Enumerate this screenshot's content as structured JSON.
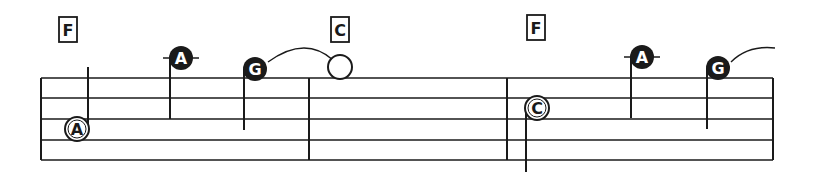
{
  "score": {
    "colors": {
      "ink": "#1a1a1a",
      "paper": "#ffffff"
    },
    "staff": {
      "x_start": 41,
      "x_end": 773,
      "lines_y": [
        78,
        98,
        119,
        140,
        160
      ]
    },
    "barlines_x": [
      41,
      309,
      507,
      773
    ],
    "chords": [
      {
        "label": "F",
        "x": 68,
        "y": 30
      },
      {
        "label": "C",
        "x": 340,
        "y": 30
      },
      {
        "label": "F",
        "x": 536,
        "y": 28
      }
    ],
    "notes": [
      {
        "name": "A",
        "x": 77,
        "y": 129,
        "style": "open",
        "stem": "up",
        "stem_top": 67,
        "stem_bottom": 129
      },
      {
        "name": "A",
        "x": 181,
        "y": 58,
        "style": "filled",
        "ledger": true,
        "stem": "down",
        "stem_top": 58,
        "stem_bottom": 119
      },
      {
        "name": "G",
        "x": 255,
        "y": 69,
        "style": "filled",
        "stem": "down",
        "stem_top": 69,
        "stem_bottom": 130
      },
      {
        "name": "",
        "x": 340,
        "y": 67,
        "style": "open-whole"
      },
      {
        "name": "C",
        "x": 537,
        "y": 108,
        "style": "open",
        "stem": "down",
        "stem_top": 108,
        "stem_bottom": 172
      },
      {
        "name": "A",
        "x": 642,
        "y": 57,
        "style": "filled",
        "ledger": true,
        "stem": "down",
        "stem_top": 57,
        "stem_bottom": 118
      },
      {
        "name": "G",
        "x": 718,
        "y": 68,
        "style": "filled",
        "stem": "down",
        "stem_top": 68,
        "stem_bottom": 129
      }
    ],
    "ties": [
      {
        "from_x": 268,
        "from_y": 62,
        "ctrl_x": 305,
        "ctrl_y": 35,
        "to_x": 333,
        "to_y": 60
      },
      {
        "from_x": 731,
        "from_y": 62,
        "ctrl_x": 748,
        "ctrl_y": 45,
        "to_x": 775,
        "to_y": 48
      }
    ]
  }
}
